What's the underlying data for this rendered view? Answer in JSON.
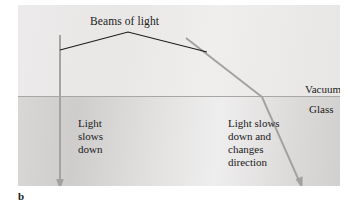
{
  "figure": {
    "panel_letter": "b",
    "caption_labels": {
      "beams": "Beams of light",
      "upper_medium": "Vacuum",
      "lower_medium": "Glass",
      "left_note": "Light\nslows\ndown",
      "right_note": "Light slows\ndown and\nchanges\ndirection"
    },
    "colors": {
      "vacuum_fill": "#eceaea",
      "glass_fill": "#d9d7d6",
      "interface_line": "#a9a7a6",
      "ray_gray": "#a3a1a0",
      "wavefront_black": "#1a1a1a",
      "text": "#1a1a1a"
    },
    "geometry": {
      "interface_y": 91,
      "vertical_ray": {
        "x": 42,
        "y_start": 30,
        "y_end": 184
      },
      "oblique_ray": {
        "incident_start_x": 168,
        "incident_start_y": 33,
        "refraction_point_x": 244,
        "refraction_point_y": 92,
        "refracted_end_x": 284,
        "refracted_end_y": 183
      },
      "wavefront": {
        "left_x": 42,
        "left_y": 45,
        "apex_x": 110,
        "apex_y": 27,
        "right_x": 189,
        "right_y": 47
      }
    }
  }
}
